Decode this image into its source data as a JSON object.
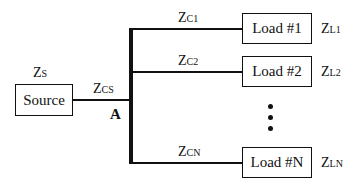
{
  "diagram": {
    "type": "single-source multi-load network",
    "source": {
      "label": "Source",
      "impedance": {
        "main": "Z",
        "sub": "S"
      }
    },
    "source_cable": {
      "impedance": {
        "main": "Z",
        "sub": "CS"
      }
    },
    "node": {
      "label": "A"
    },
    "loads": [
      {
        "label": "Load #1",
        "cable": {
          "main": "Z",
          "sub": "C1"
        },
        "impedance": {
          "main": "Z",
          "sub": "L1"
        }
      },
      {
        "label": "Load #2",
        "cable": {
          "main": "Z",
          "sub": "C2"
        },
        "impedance": {
          "main": "Z",
          "sub": "L2"
        }
      },
      {
        "label": "Load #N",
        "cable": {
          "main": "Z",
          "sub": "CN"
        },
        "impedance": {
          "main": "Z",
          "sub": "LN"
        }
      }
    ],
    "ellipsis": "⋮"
  }
}
